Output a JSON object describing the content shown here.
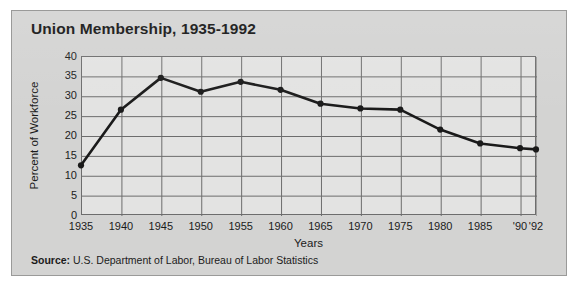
{
  "figure": {
    "title": "Union Membership, 1935-1992",
    "source_label": "Source:",
    "source_text": " U.S. Department of Labor, Bureau of Labor Statistics",
    "panel_color": "#d3d3d2",
    "plot_color": "#e3e3e2",
    "line_color": "#1a1a1a",
    "grid_color": "#6d6d6d"
  },
  "chart_data": {
    "type": "line",
    "title": "Union Membership, 1935-1992",
    "xlabel": "Years",
    "ylabel": "Percent of Workforce",
    "categories": [
      "1935",
      "1940",
      "1945",
      "1950",
      "1955",
      "1960",
      "1965",
      "1970",
      "1975",
      "1980",
      "1985",
      "'90",
      "'92"
    ],
    "x_values": [
      1935,
      1940,
      1945,
      1950,
      1955,
      1960,
      1965,
      1970,
      1975,
      1980,
      1985,
      1990,
      1992
    ],
    "values": [
      12.5,
      26.5,
      34.5,
      31.0,
      33.5,
      31.5,
      28.0,
      26.8,
      26.5,
      21.5,
      18.0,
      16.8,
      16.5
    ],
    "ylim": [
      0,
      40
    ],
    "yticks": [
      40,
      35,
      30,
      25,
      20,
      15,
      10,
      5,
      0
    ],
    "xlim": [
      1935,
      1992
    ],
    "grid": true,
    "legend": false,
    "marker": "filled-circle",
    "series": [
      {
        "name": "Percent of Workforce",
        "values": [
          12.5,
          26.5,
          34.5,
          31.0,
          33.5,
          31.5,
          28.0,
          26.8,
          26.5,
          21.5,
          18.0,
          16.8,
          16.5
        ]
      }
    ]
  }
}
